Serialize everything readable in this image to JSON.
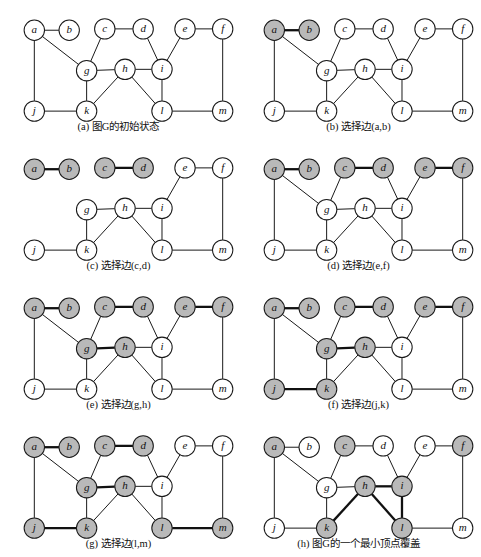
{
  "figure": {
    "node_fill_selected": "#b9b9b9",
    "node_fill_default": "#ffffff",
    "edge_color": "#1a1a1a"
  },
  "graph": {
    "nodes": [
      {
        "id": "a",
        "label": "a",
        "x": 32,
        "y": 30
      },
      {
        "id": "b",
        "label": "b",
        "x": 82,
        "y": 30
      },
      {
        "id": "c",
        "label": "c",
        "x": 133,
        "y": 28
      },
      {
        "id": "d",
        "label": "d",
        "x": 188,
        "y": 28
      },
      {
        "id": "e",
        "label": "e",
        "x": 248,
        "y": 28
      },
      {
        "id": "f",
        "label": "f",
        "x": 302,
        "y": 28
      },
      {
        "id": "g",
        "label": "g",
        "x": 107,
        "y": 90
      },
      {
        "id": "h",
        "label": "h",
        "x": 162,
        "y": 88
      },
      {
        "id": "i",
        "label": "i",
        "x": 215,
        "y": 88
      },
      {
        "id": "j",
        "label": "j",
        "x": 32,
        "y": 150
      },
      {
        "id": "k",
        "label": "k",
        "x": 107,
        "y": 150
      },
      {
        "id": "l",
        "label": "l",
        "x": 215,
        "y": 150
      },
      {
        "id": "m",
        "label": "m",
        "x": 302,
        "y": 150
      }
    ],
    "edges": [
      [
        "a",
        "b"
      ],
      [
        "a",
        "g"
      ],
      [
        "a",
        "j"
      ],
      [
        "c",
        "d"
      ],
      [
        "c",
        "g"
      ],
      [
        "d",
        "i"
      ],
      [
        "e",
        "f"
      ],
      [
        "e",
        "i"
      ],
      [
        "f",
        "m"
      ],
      [
        "g",
        "h"
      ],
      [
        "g",
        "k"
      ],
      [
        "h",
        "i"
      ],
      [
        "h",
        "k"
      ],
      [
        "h",
        "l"
      ],
      [
        "i",
        "l"
      ],
      [
        "j",
        "k"
      ],
      [
        "l",
        "m"
      ]
    ]
  },
  "panels": [
    {
      "key": "a",
      "caption_prefix": "(a)",
      "caption_text": "图G的初始状态",
      "selected_nodes": [],
      "bold_edges": [],
      "hidden_edges": []
    },
    {
      "key": "b",
      "caption_prefix": "(b)",
      "caption_text": "选择边(a,b)",
      "selected_nodes": [
        "a",
        "b"
      ],
      "bold_edges": [
        [
          "a",
          "b"
        ]
      ],
      "hidden_edges": []
    },
    {
      "key": "c",
      "caption_prefix": "(c)",
      "caption_text": "选择边(c,d)",
      "selected_nodes": [
        "a",
        "b",
        "c",
        "d"
      ],
      "bold_edges": [
        [
          "a",
          "b"
        ],
        [
          "c",
          "d"
        ]
      ],
      "hidden_edges": [
        [
          "a",
          "g"
        ],
        [
          "a",
          "j"
        ],
        [
          "c",
          "g"
        ],
        [
          "d",
          "i"
        ]
      ]
    },
    {
      "key": "d",
      "caption_prefix": "(d)",
      "caption_text": "选择边(e,f)",
      "selected_nodes": [
        "a",
        "b",
        "c",
        "d",
        "e",
        "f"
      ],
      "bold_edges": [
        [
          "a",
          "b"
        ],
        [
          "c",
          "d"
        ],
        [
          "e",
          "f"
        ]
      ],
      "hidden_edges": []
    },
    {
      "key": "e",
      "caption_prefix": "(e)",
      "caption_text": "选择边(g,h)",
      "selected_nodes": [
        "a",
        "b",
        "c",
        "d",
        "e",
        "f",
        "g",
        "h"
      ],
      "bold_edges": [
        [
          "a",
          "b"
        ],
        [
          "c",
          "d"
        ],
        [
          "e",
          "f"
        ],
        [
          "g",
          "h"
        ]
      ],
      "hidden_edges": []
    },
    {
      "key": "f",
      "caption_prefix": "(f)",
      "caption_text": "选择边(j,k)",
      "selected_nodes": [
        "a",
        "b",
        "c",
        "d",
        "e",
        "f",
        "g",
        "h",
        "j",
        "k"
      ],
      "bold_edges": [
        [
          "a",
          "b"
        ],
        [
          "c",
          "d"
        ],
        [
          "e",
          "f"
        ],
        [
          "g",
          "h"
        ],
        [
          "j",
          "k"
        ]
      ],
      "hidden_edges": []
    },
    {
      "key": "g",
      "caption_prefix": "(g)",
      "caption_text": "选择边(l,m)",
      "selected_nodes": [
        "a",
        "b",
        "c",
        "d",
        "g",
        "h",
        "j",
        "k",
        "l",
        "m"
      ],
      "bold_edges": [
        [
          "a",
          "b"
        ],
        [
          "c",
          "d"
        ],
        [
          "g",
          "h"
        ],
        [
          "j",
          "k"
        ],
        [
          "l",
          "m"
        ]
      ],
      "hidden_edges": []
    },
    {
      "key": "h",
      "caption_prefix": "(h)",
      "caption_text": "图G的一个最小顶点覆盖",
      "selected_nodes": [
        "a",
        "c",
        "f",
        "h",
        "i",
        "k",
        "l"
      ],
      "bold_edges": [
        [
          "h",
          "i"
        ],
        [
          "h",
          "k"
        ],
        [
          "h",
          "l"
        ],
        [
          "i",
          "l"
        ]
      ],
      "hidden_edges": []
    }
  ]
}
